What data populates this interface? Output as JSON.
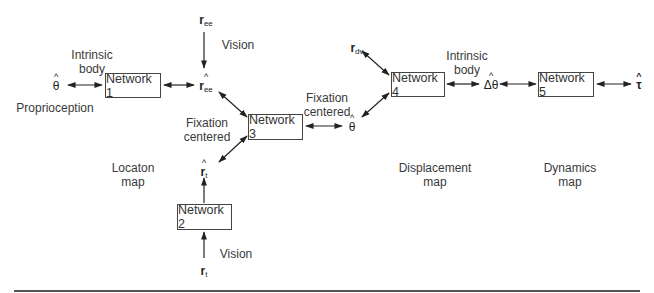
{
  "networks": [
    {
      "id": 1,
      "label": "Network 1"
    },
    {
      "id": 2,
      "label": "Network 2"
    },
    {
      "id": 3,
      "label": "Network 3"
    },
    {
      "id": 4,
      "label": "Network 4"
    },
    {
      "id": 5,
      "label": "Network 5"
    }
  ],
  "labels": {
    "intrinsic_body_left_1": "Intrinsic",
    "intrinsic_body_left_2": "body",
    "proprioception": "Proprioception",
    "vision_top": "Vision",
    "fixation_centered_left_1": "Fixation",
    "fixation_centered_left_2": "centered",
    "fixation_centered_right_1": "Fixation",
    "fixation_centered_right_2": "centered",
    "location_map_1": "Locaton",
    "location_map_2": "map",
    "vision_bottom": "Vision",
    "intrinsic_body_right_1": "Intrinsic",
    "intrinsic_body_right_2": "body",
    "displacement_map_1": "Displacement",
    "displacement_map_2": "map",
    "dynamics_map_1": "Dynamics",
    "dynamics_map_2": "map"
  },
  "symbols": {
    "theta_hat_left": {
      "hat": "^",
      "base": "θ",
      "sub": ""
    },
    "r_ee": {
      "hat": "",
      "base": "r",
      "sub": "ee"
    },
    "r_ee_hat": {
      "hat": "^",
      "base": "r",
      "sub": "ee"
    },
    "r_t_hat": {
      "hat": "^",
      "base": "r",
      "sub": "t"
    },
    "r_t": {
      "hat": "",
      "base": "r",
      "sub": "t"
    },
    "theta_hat_mid": {
      "hat": "^",
      "base": "θ",
      "sub": ""
    },
    "r_dv": {
      "hat": "",
      "base": "r",
      "sub": "dv"
    },
    "delta_theta_hat": {
      "hat": "^",
      "base": "Δθ",
      "sub": ""
    },
    "tau_hat": {
      "hat": "^",
      "base": "τ",
      "sub": ""
    }
  }
}
